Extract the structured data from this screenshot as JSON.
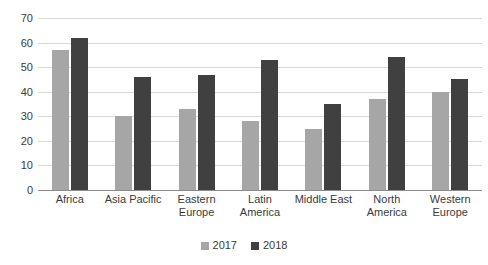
{
  "chart_data": {
    "type": "bar",
    "title": "",
    "subtitle": "",
    "xlabel": "",
    "ylabel": "",
    "ylim": [
      0,
      70
    ],
    "ytick_step": 10,
    "yticks": [
      70,
      60,
      50,
      40,
      30,
      20,
      10,
      0
    ],
    "grid": true,
    "legend_position": "bottom-center",
    "categories": [
      "Africa",
      "Asia Pacific",
      "Eastern\nEurope",
      "Latin\nAmerica",
      "Middle East",
      "North\nAmerica",
      "Western\nEurope"
    ],
    "series": [
      {
        "name": "2017",
        "color": "#a6a6a6",
        "values": [
          57,
          30,
          33,
          28,
          25,
          37,
          40
        ]
      },
      {
        "name": "2018",
        "color": "#404040",
        "values": [
          62,
          46,
          47,
          53,
          35,
          54,
          45
        ]
      }
    ]
  },
  "colors": {
    "series_2017": "#a6a6a6",
    "series_2018": "#404040",
    "gridline": "#d9d9d9",
    "axis": "#8c8c8c",
    "text": "#3b3b3b",
    "background": "#ffffff"
  }
}
